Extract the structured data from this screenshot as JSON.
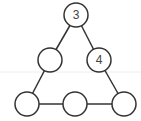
{
  "diagram": {
    "type": "triangle-number-puzzle",
    "stroke_color": "#333333",
    "fill_color": "#ffffff",
    "nodes": [
      {
        "id": "top",
        "x": 76,
        "y": 15,
        "label": "3"
      },
      {
        "id": "left-mid",
        "x": 50,
        "y": 60,
        "label": ""
      },
      {
        "id": "right-mid",
        "x": 99,
        "y": 60,
        "label": "4"
      },
      {
        "id": "bottom-left",
        "x": 27,
        "y": 104,
        "label": ""
      },
      {
        "id": "bottom-mid",
        "x": 75,
        "y": 104,
        "label": ""
      },
      {
        "id": "bottom-right",
        "x": 124,
        "y": 104,
        "label": ""
      }
    ],
    "radius": 12,
    "edges": [
      [
        "top",
        "left-mid"
      ],
      [
        "left-mid",
        "bottom-left"
      ],
      [
        "top",
        "right-mid"
      ],
      [
        "right-mid",
        "bottom-right"
      ],
      [
        "bottom-left",
        "bottom-mid"
      ],
      [
        "bottom-mid",
        "bottom-right"
      ]
    ]
  }
}
